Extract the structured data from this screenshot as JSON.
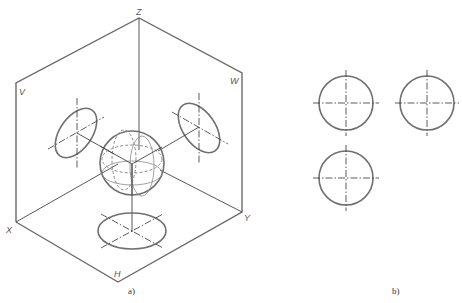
{
  "figure": {
    "panel_a": {
      "caption": "a)",
      "labels": {
        "z": "Z",
        "v": "V",
        "w": "W",
        "x": "X",
        "y": "Y",
        "h": "H"
      },
      "description": "Isometric view of a sphere placed in the corner of three projection planes V, W, H with its circular projections drawn on each plane"
    },
    "panel_b": {
      "caption": "b)",
      "description": "Three orthographic views of the sphere: three equal circles with center lines"
    }
  }
}
